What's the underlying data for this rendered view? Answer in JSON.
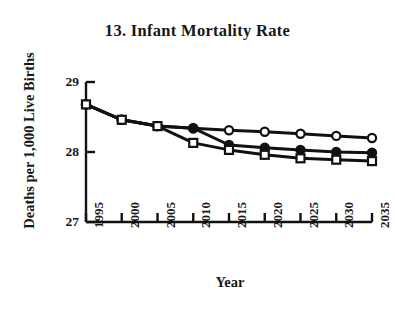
{
  "chart_data": {
    "type": "line",
    "title": "13. Infant Mortality Rate",
    "xlabel": "Year",
    "ylabel": "Deaths per 1,000 Live Births",
    "x": [
      1995,
      2000,
      2005,
      2010,
      2015,
      2020,
      2025,
      2030,
      2035
    ],
    "categories": [
      "1995",
      "2000",
      "2005",
      "2010",
      "2015",
      "2020",
      "2025",
      "2030",
      "2035"
    ],
    "xlim": [
      1995,
      2035
    ],
    "ylim": [
      27,
      29
    ],
    "yticks": [
      27,
      28,
      29
    ],
    "ytick_labels": [
      "27",
      "28",
      "29"
    ],
    "grid": false,
    "legend": "none",
    "series": [
      {
        "name": "series-high",
        "marker": "open-circle",
        "values": [
          28.68,
          28.46,
          28.37,
          28.34,
          28.31,
          28.29,
          28.26,
          28.23,
          28.2
        ]
      },
      {
        "name": "series-mid",
        "marker": "filled-circle",
        "values": [
          28.68,
          28.46,
          28.37,
          28.34,
          28.1,
          28.06,
          28.03,
          28.0,
          27.99
        ]
      },
      {
        "name": "series-low",
        "marker": "open-square",
        "values": [
          28.68,
          28.46,
          28.37,
          28.13,
          28.03,
          27.96,
          27.91,
          27.89,
          27.87
        ]
      }
    ],
    "colors": {
      "line": "#111111",
      "axis": "#111111",
      "marker_fill": "#ffffff",
      "marker_edge": "#111111",
      "background": "#ffffff"
    }
  }
}
